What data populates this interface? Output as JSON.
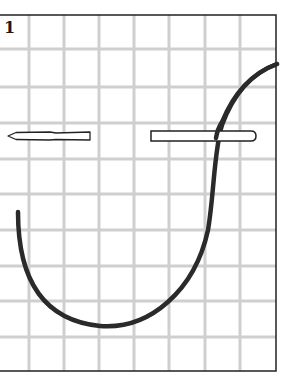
{
  "figure": {
    "step_number": "1",
    "background_color": "#ffffff",
    "frame_color": "#222222",
    "grid_color": "#cfcfcf",
    "curve_color": "#2a2a2a",
    "frame": {
      "left": 0,
      "top": 15,
      "right": 276,
      "bottom": 371
    },
    "grid": {
      "vertical_x": [
        29,
        64,
        99,
        134,
        169,
        205,
        240
      ],
      "horizontal_y": [
        49,
        87,
        123,
        159,
        194,
        230,
        266,
        301,
        337
      ]
    },
    "needles": [
      {
        "name": "left-needle",
        "x1": 8,
        "x2": 90,
        "y": 136,
        "pointed_end": "left"
      },
      {
        "name": "right-needle",
        "x1": 151,
        "x2": 256,
        "y": 136,
        "rounded_end": "right"
      }
    ],
    "thread_path": "M18,212 C18,275 40,320 100,326 C150,330 195,290 208,230 C214,195 214,150 222,125 C235,90 255,72 277,64"
  }
}
